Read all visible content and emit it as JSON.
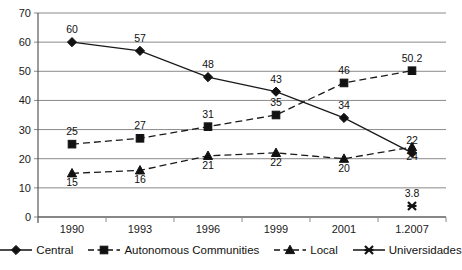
{
  "chart_data": {
    "type": "line",
    "title": "",
    "subtitle": "",
    "xlabel": "",
    "ylabel": "",
    "categories": [
      "1990",
      "1993",
      "1996",
      "1999",
      "2001",
      "1.2007"
    ],
    "ylim": [
      0,
      70
    ],
    "ytick_step": 10,
    "yticks": [
      "0",
      "10",
      "20",
      "30",
      "40",
      "50",
      "60",
      "70"
    ],
    "grid": true,
    "legend_position": "bottom",
    "series": [
      {
        "name": "Central",
        "marker": "diamond",
        "line": "solid",
        "color": "#111111",
        "values": [
          60,
          57,
          48,
          43,
          34,
          22
        ],
        "labels": [
          "60",
          "57",
          "48",
          "43",
          "34",
          "22"
        ]
      },
      {
        "name": "Autonomous Communities",
        "marker": "square",
        "line": "dashed",
        "color": "#111111",
        "values": [
          25,
          27,
          31,
          35,
          46,
          50.2
        ],
        "labels": [
          "25",
          "27",
          "31",
          "35",
          "46",
          "50.2"
        ]
      },
      {
        "name": "Local",
        "marker": "triangle",
        "line": "dashed",
        "color": "#111111",
        "values": [
          15,
          16,
          21,
          22,
          20,
          24
        ],
        "labels": [
          "15",
          "16",
          "21",
          "22",
          "20",
          "24"
        ]
      },
      {
        "name": "Universidades",
        "marker": "cross",
        "line": "solid",
        "color": "#111111",
        "values": [
          null,
          null,
          null,
          null,
          null,
          3.8
        ],
        "labels": [
          "",
          "",
          "",
          "",
          "",
          "3.8"
        ]
      }
    ]
  },
  "legend": {
    "items": [
      {
        "label": "Central"
      },
      {
        "label": "Autonomous Communities"
      },
      {
        "label": "Local"
      },
      {
        "label": "Universidades"
      }
    ]
  },
  "axis": {
    "y_labels": [
      "70",
      "60",
      "50",
      "40",
      "30",
      "20",
      "10",
      "0"
    ],
    "x_labels": [
      "1990",
      "1993",
      "1996",
      "1999",
      "2001",
      "1.2007"
    ]
  }
}
